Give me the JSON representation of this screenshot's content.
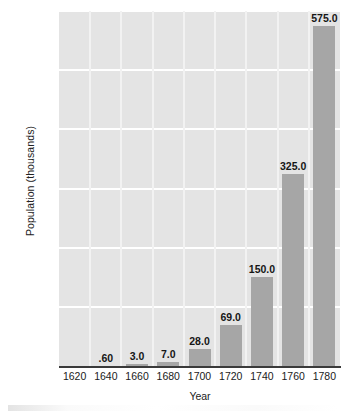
{
  "chart_data": {
    "type": "bar",
    "title": "",
    "subtitle": "",
    "xlabel": "Year",
    "ylabel": "Population (thousands)",
    "categories": [
      "1620",
      "1640",
      "1660",
      "1680",
      "1700",
      "1720",
      "1740",
      "1760",
      "1780"
    ],
    "values": [
      0,
      0.6,
      3.0,
      7.0,
      28.0,
      69.0,
      150.0,
      325.0,
      575.0
    ],
    "data_labels": [
      "",
      ".60",
      "3.0",
      "7.0",
      "28.0",
      "69.0",
      "150.0",
      "325.0",
      "575.0"
    ],
    "ylim": [
      0,
      600
    ],
    "yticks": [
      0,
      100,
      200,
      300,
      400,
      500,
      600
    ],
    "ytick_labels": [
      "0",
      "100",
      "200",
      "300",
      "400",
      "500",
      "600"
    ],
    "xtick_labels": [
      "1620",
      "1640",
      "1660",
      "1680",
      "1700",
      "1720",
      "1740",
      "1760",
      "1780"
    ],
    "grid": "horizontal-and-vertical",
    "legend": "none",
    "bar_color": "#a6a6a6",
    "plot_background": "#e4e4e4",
    "gridline_color": "#ffffff",
    "axis_color": "#3a3a3a",
    "text_color": "#1a1a1a"
  }
}
